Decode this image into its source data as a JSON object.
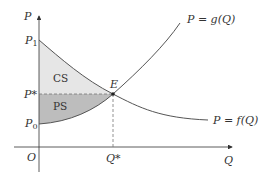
{
  "axes": {
    "y_label": "P",
    "x_label": "Q",
    "origin_label": "O"
  },
  "price_labels": {
    "p1": "P",
    "p1_sub": "1",
    "p_star": "P*",
    "p0": "P",
    "p0_sub": "0"
  },
  "quantity_labels": {
    "q_star": "Q*"
  },
  "equilibrium_label": "E",
  "regions": {
    "consumer_surplus": "CS",
    "producer_surplus": "PS"
  },
  "curves": {
    "supply": "P = g(Q)",
    "demand": "P = f(Q)"
  },
  "colors": {
    "cs_fill": "#e6e6e6",
    "ps_fill": "#bdbdbd",
    "curve": "#555555",
    "axis": "#333333",
    "dashed": "#777777"
  }
}
